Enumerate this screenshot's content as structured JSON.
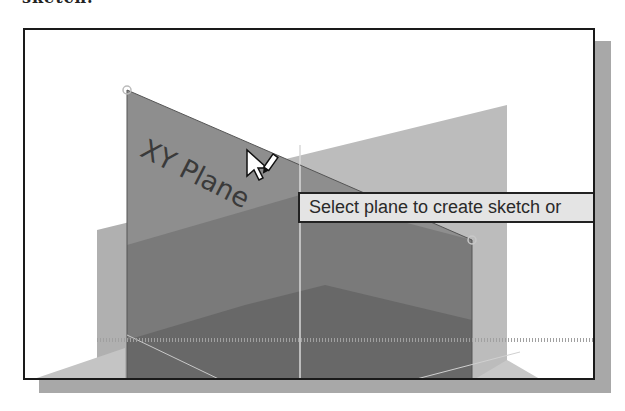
{
  "caption_fragment": "sketch.",
  "viewport": {
    "background": "#ffffff",
    "border_color": "#1a1a1a",
    "shadow_color": "#a8a8a8"
  },
  "planes": [
    {
      "name": "XY Plane",
      "label": "XY Plane",
      "state": "highlighted",
      "color": "#8c8c8c"
    },
    {
      "name": "YZ Plane",
      "color": "#b4b4b4"
    },
    {
      "name": "XZ Plane",
      "color": "#7a7a7a"
    }
  ],
  "cursor": {
    "type": "select-plane-cursor",
    "x": 258,
    "y": 152
  },
  "tooltip": {
    "text": "Select plane to create sketch or"
  },
  "colors": {
    "light_plane": "#b9b9b9",
    "mid_plane": "#8a8a8a",
    "dark_plane": "#6e6e6e",
    "darker_region": "#606060",
    "highlight_plane": "#929292",
    "tooltip_bg": "#e4e4e4"
  }
}
